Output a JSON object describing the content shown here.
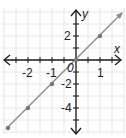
{
  "chart_data": {
    "type": "line",
    "title": "",
    "xlabel": "x",
    "ylabel": "y",
    "origin_label": "0",
    "xlim": [
      -3.1,
      2.0
    ],
    "ylim": [
      -6.2,
      4.0
    ],
    "grid": true,
    "x_ticks": [
      -2,
      -1,
      1
    ],
    "y_ticks": [
      2,
      -2,
      -4
    ],
    "x_tick_labels": [
      "-2",
      "-1",
      "1"
    ],
    "y_tick_labels": [
      "2",
      "-2",
      "-4"
    ],
    "series": [
      {
        "name": "y = 2x",
        "x": [
          -3,
          -2,
          -1,
          0,
          1
        ],
        "y": [
          -6,
          -4,
          -2,
          0,
          2
        ],
        "color": "#8c8c8c",
        "marker_color": "#777777"
      }
    ]
  },
  "colors": {
    "axis": "#1a1a1a",
    "grid": "#e6e6e6",
    "line": "#8c8c8c"
  }
}
